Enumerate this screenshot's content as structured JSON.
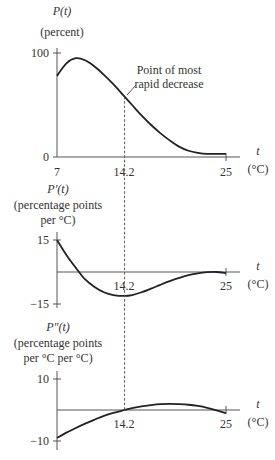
{
  "chart_data": [
    {
      "type": "line",
      "ylabel_line1": "P(t)",
      "ylabel_line2": "(percent)",
      "xlabel": "t",
      "xunit": "(°C)",
      "xlim": [
        7,
        25
      ],
      "ylim": [
        0,
        100
      ],
      "yticks": [
        "0",
        "100"
      ],
      "xticks": [
        "7",
        "14.2",
        "25"
      ],
      "annotation_line1": "Point of most",
      "annotation_line2": "rapid decrease",
      "annotation_x": 14.2,
      "x": [
        7,
        8,
        9,
        10,
        11,
        12,
        13,
        14.2,
        15,
        16,
        17,
        18,
        19,
        20,
        21,
        22,
        23,
        24,
        25
      ],
      "values": [
        78,
        90,
        95,
        93,
        87,
        79,
        70,
        58,
        50,
        40,
        31,
        23,
        16,
        10,
        6,
        4,
        3,
        3,
        3
      ]
    },
    {
      "type": "line",
      "ylabel_line1": "P′(t)",
      "ylabel_line2": "(percentage points",
      "ylabel_line3": "per °C)",
      "xlabel": "t",
      "xunit": "(°C)",
      "xlim": [
        7,
        25
      ],
      "ylim": [
        -15,
        15
      ],
      "yticks": [
        "15",
        "−15"
      ],
      "xticks": [
        "14.2",
        "25"
      ],
      "x": [
        7,
        8,
        9,
        10,
        11,
        12,
        13,
        14.2,
        15,
        16,
        17,
        18,
        19,
        20,
        21,
        22,
        23,
        24,
        25
      ],
      "values": [
        15,
        8,
        2,
        -3.5,
        -7,
        -9.5,
        -10.8,
        -11.2,
        -10.8,
        -9.5,
        -7.8,
        -6,
        -4.3,
        -2.8,
        -1.5,
        -0.6,
        -0.1,
        0,
        -0.5
      ]
    },
    {
      "type": "line",
      "ylabel_line1": "P″(t)",
      "ylabel_line2": "(percentage points",
      "ylabel_line3": "per °C per °C)",
      "xlabel": "t",
      "xunit": "(°C)",
      "xlim": [
        7,
        25
      ],
      "ylim": [
        -10,
        10
      ],
      "yticks": [
        "10",
        "−10"
      ],
      "xticks": [
        "14.2",
        "25"
      ],
      "x": [
        7,
        8,
        9,
        10,
        11,
        12,
        13,
        14.2,
        15,
        16,
        17,
        18,
        19,
        20,
        21,
        22,
        23,
        24,
        25
      ],
      "values": [
        -9,
        -7.3,
        -5.8,
        -4.4,
        -3.1,
        -1.9,
        -0.9,
        0,
        0.6,
        1.2,
        1.6,
        1.9,
        2,
        1.9,
        1.7,
        1.3,
        0.7,
        -0.1,
        -1
      ]
    }
  ]
}
